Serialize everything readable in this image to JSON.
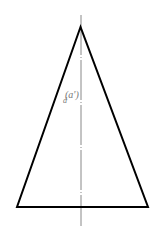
{
  "diagram": {
    "type": "orthographic-projection",
    "shape": "isosceles-triangle",
    "label_prefix": "d",
    "label": "(a')",
    "colors": {
      "outline": "#000000",
      "axis": "#888888",
      "label": "#777777"
    }
  }
}
